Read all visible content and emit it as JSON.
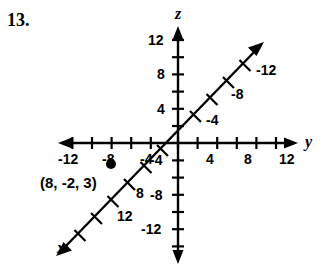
{
  "figure": {
    "problem_number": "13.",
    "width": 328,
    "height": 274,
    "background_color": "#ffffff",
    "stroke_color": "#000000"
  },
  "axes": {
    "y_axis": {
      "name": "y",
      "orientation": "horizontal",
      "origin_px": [
        178,
        143
      ],
      "negative_labels": [
        "-12",
        "-8",
        "-4"
      ],
      "positive_labels": [
        "4",
        "8",
        "12"
      ],
      "tick_interval": 2,
      "label_interval": 4,
      "range": [
        -13,
        13
      ]
    },
    "z_axis": {
      "name": "z",
      "orientation": "vertical",
      "positive_labels": [
        "12",
        "8",
        "4"
      ],
      "negative_labels": [
        "-4",
        "-8",
        "-12"
      ],
      "tick_interval": 2,
      "label_interval": 4,
      "range": [
        -13,
        13
      ]
    },
    "x_axis": {
      "name": "x",
      "orientation": "diagonal",
      "upper_right_labels": [
        "-4",
        "-8",
        "-12"
      ],
      "lower_left_labels": [
        "8",
        "12"
      ],
      "tick_interval": 2,
      "label_interval": 4,
      "range": [
        -13,
        13
      ]
    }
  },
  "annotations": {
    "plotted_point_label": "(8, -2, 3)",
    "plotted_point_marker": "dot"
  },
  "labels": {
    "z_12": "12",
    "z_8": "8",
    "z_4": "4",
    "z_neg4": "-4",
    "z_neg8": "-8",
    "z_neg12": "-12",
    "y_neg12": "-12",
    "y_neg8": "-8",
    "y_neg4": "-4",
    "y_4": "4",
    "y_8": "8",
    "y_12": "12",
    "x_neg4": "-4",
    "x_neg8": "-8",
    "x_neg12": "-12",
    "x_8": "8",
    "x_12": "12",
    "axis_x": "x",
    "axis_y": "y",
    "axis_z": "z"
  }
}
